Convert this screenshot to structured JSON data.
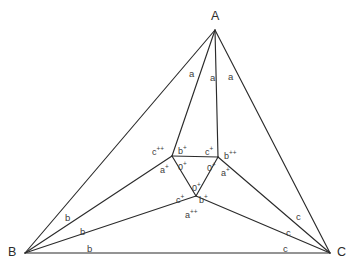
{
  "figure": {
    "type": "geometry-diagram",
    "background_color": "#ffffff",
    "line_color": "#2b2b2b",
    "text_color": "#3c3c3c",
    "canvas": {
      "width": 356,
      "height": 278
    }
  },
  "vertices": {
    "A": {
      "label": "A",
      "x": 215,
      "y": 30,
      "label_x": 211,
      "label_y": 10
    },
    "B": {
      "label": "B",
      "x": 25,
      "y": 253,
      "label_x": 8,
      "label_y": 246
    },
    "C": {
      "label": "C",
      "x": 330,
      "y": 253,
      "label_x": 337,
      "label_y": 246
    }
  },
  "inner_points": {
    "P_left": {
      "x": 172,
      "y": 156
    },
    "P_right": {
      "x": 218,
      "y": 157
    },
    "P_bottom": {
      "x": 196,
      "y": 196
    }
  },
  "side_labels": {
    "a": [
      {
        "text": "a",
        "x": 189,
        "y": 69
      },
      {
        "text": "a",
        "x": 210,
        "y": 73
      },
      {
        "text": "a",
        "x": 228,
        "y": 72
      }
    ],
    "b": [
      {
        "text": "b",
        "x": 65,
        "y": 213
      },
      {
        "text": "b",
        "x": 80,
        "y": 227
      },
      {
        "text": "b",
        "x": 87,
        "y": 244
      }
    ],
    "c": [
      {
        "text": "c",
        "x": 296,
        "y": 212
      },
      {
        "text": "c",
        "x": 286,
        "y": 228
      },
      {
        "text": "c",
        "x": 283,
        "y": 244
      }
    ]
  },
  "inner_labels": [
    {
      "base": "c",
      "sup": "++",
      "x": 152,
      "y": 146,
      "key": "c-double-plus-left"
    },
    {
      "base": "b",
      "sup": "+",
      "x": 178,
      "y": 145,
      "key": "b-plus-upper-left"
    },
    {
      "base": "c",
      "sup": "+",
      "x": 205,
      "y": 146,
      "key": "c-plus-upper-right"
    },
    {
      "base": "b",
      "sup": "++",
      "x": 224,
      "y": 150,
      "key": "b-double-plus-right"
    },
    {
      "base": "a",
      "sup": "+",
      "x": 160,
      "y": 164,
      "key": "a-plus-left"
    },
    {
      "base": "0",
      "sup": "+",
      "x": 178,
      "y": 161,
      "key": "zero-plus-upper-left"
    },
    {
      "base": "0",
      "sup": "+",
      "x": 207,
      "y": 162,
      "key": "zero-plus-upper-right"
    },
    {
      "base": "a",
      "sup": "+",
      "x": 221,
      "y": 167,
      "key": "a-plus-right"
    },
    {
      "base": "0",
      "sup": "+",
      "x": 192,
      "y": 182,
      "key": "zero-plus-lower"
    },
    {
      "base": "c",
      "sup": "+",
      "x": 176,
      "y": 194,
      "key": "c-plus-lower-left"
    },
    {
      "base": "b",
      "sup": "+",
      "x": 199,
      "y": 194,
      "key": "b-plus-lower-right"
    },
    {
      "base": "a",
      "sup": "++",
      "x": 185,
      "y": 209,
      "key": "a-double-plus-bottom"
    }
  ],
  "segments": [
    {
      "name": "side-AB",
      "from": [
        215,
        30
      ],
      "to": [
        25,
        253
      ]
    },
    {
      "name": "side-AC",
      "from": [
        215,
        30
      ],
      "to": [
        330,
        253
      ]
    },
    {
      "name": "side-BC",
      "from": [
        25,
        253
      ],
      "to": [
        330,
        253
      ]
    },
    {
      "name": "cevian-A-to-left-inner",
      "from": [
        215,
        30
      ],
      "to": [
        172,
        156
      ]
    },
    {
      "name": "cevian-A-to-right-inner",
      "from": [
        215,
        30
      ],
      "to": [
        218,
        157
      ]
    },
    {
      "name": "cevian-B-to-left-inner",
      "from": [
        25,
        253
      ],
      "to": [
        172,
        156
      ]
    },
    {
      "name": "cevian-B-to-bottom-inner",
      "from": [
        25,
        253
      ],
      "to": [
        196,
        196
      ]
    },
    {
      "name": "cevian-C-to-right-inner",
      "from": [
        330,
        253
      ],
      "to": [
        218,
        157
      ]
    },
    {
      "name": "cevian-C-to-bottom-inner",
      "from": [
        330,
        253
      ],
      "to": [
        196,
        196
      ]
    },
    {
      "name": "inner-edge-left-right",
      "from": [
        172,
        156
      ],
      "to": [
        218,
        157
      ]
    },
    {
      "name": "inner-edge-left-bottom",
      "from": [
        172,
        156
      ],
      "to": [
        196,
        196
      ]
    },
    {
      "name": "inner-edge-right-bottom",
      "from": [
        218,
        157
      ],
      "to": [
        196,
        196
      ]
    }
  ]
}
